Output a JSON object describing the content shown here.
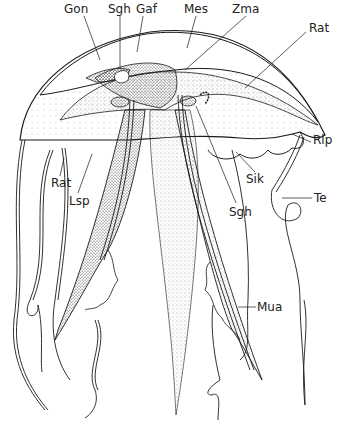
{
  "figure": {
    "background": "#ffffff",
    "ink_color": "#1a1a1a",
    "labels": [
      {
        "id": "gon",
        "text": "Gon",
        "x": 64,
        "y": 3
      },
      {
        "id": "sgh-top",
        "text": "Sgh",
        "x": 108,
        "y": 3
      },
      {
        "id": "gaf",
        "text": "Gaf",
        "x": 136,
        "y": 3
      },
      {
        "id": "mes",
        "text": "Mes",
        "x": 184,
        "y": 3
      },
      {
        "id": "zma",
        "text": "Zma",
        "x": 232,
        "y": 3
      },
      {
        "id": "rat-right",
        "text": "Rat",
        "x": 309,
        "y": 22
      },
      {
        "id": "rlp",
        "text": "Rlp",
        "x": 313,
        "y": 134
      },
      {
        "id": "sik",
        "text": "Sik",
        "x": 246,
        "y": 173
      },
      {
        "id": "te",
        "text": "Te",
        "x": 314,
        "y": 192
      },
      {
        "id": "sgh-bottom",
        "text": "Sgh",
        "x": 229,
        "y": 206
      },
      {
        "id": "rat-left",
        "text": "Rat",
        "x": 51,
        "y": 177
      },
      {
        "id": "lsp",
        "text": "Lsp",
        "x": 69,
        "y": 195
      },
      {
        "id": "mua",
        "text": "Mua",
        "x": 257,
        "y": 301
      }
    ]
  }
}
